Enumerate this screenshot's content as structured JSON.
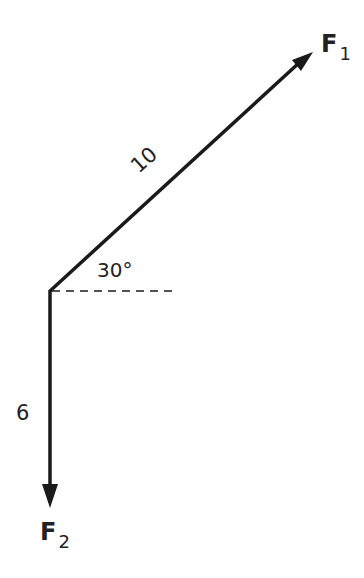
{
  "diagram": {
    "type": "vector force diagram",
    "vectors": [
      {
        "name": "F",
        "subscript": "1",
        "magnitude_label": "10",
        "direction": "30° above horizontal"
      },
      {
        "name": "F",
        "subscript": "2",
        "magnitude_label": "6",
        "direction": "straight down"
      }
    ],
    "angle_label": "30°",
    "colors": {
      "ink": "#1a1a1a",
      "background": "#ffffff"
    }
  }
}
